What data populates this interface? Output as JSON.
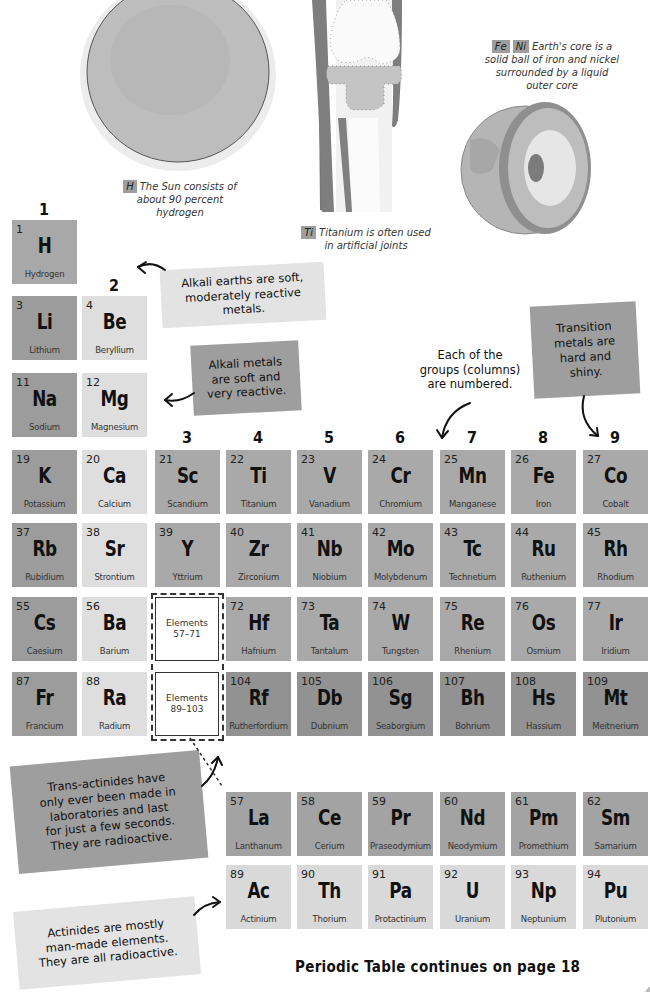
{
  "illustrations": {
    "sun": {
      "tag": "H",
      "caption_lines": [
        "The Sun consists of",
        "about 90 percent",
        "hydrogen"
      ]
    },
    "knee_joint": {
      "tag": "Ti",
      "caption_lines": [
        "Titanium is often used",
        "in artificial joints"
      ]
    },
    "earth_core": {
      "tags": [
        "Fe",
        "Ni"
      ],
      "caption_lines": [
        "Earth's core is a",
        "solid ball of iron and nickel",
        "surrounded by a liquid",
        "outer core"
      ]
    }
  },
  "group_numbers": [
    "1",
    "2",
    "3",
    "4",
    "5",
    "6",
    "7",
    "8",
    "9"
  ],
  "elements": {
    "H": {
      "number": "1",
      "symbol": "H",
      "name": "Hydrogen"
    },
    "Li": {
      "number": "3",
      "symbol": "Li",
      "name": "Lithium"
    },
    "Be": {
      "number": "4",
      "symbol": "Be",
      "name": "Beryllium"
    },
    "Na": {
      "number": "11",
      "symbol": "Na",
      "name": "Sodium"
    },
    "Mg": {
      "number": "12",
      "symbol": "Mg",
      "name": "Magnesium"
    },
    "K": {
      "number": "19",
      "symbol": "K",
      "name": "Potassium"
    },
    "Ca": {
      "number": "20",
      "symbol": "Ca",
      "name": "Calcium"
    },
    "Sc": {
      "number": "21",
      "symbol": "Sc",
      "name": "Scandium"
    },
    "Ti": {
      "number": "22",
      "symbol": "Ti",
      "name": "Titanium"
    },
    "V": {
      "number": "23",
      "symbol": "V",
      "name": "Vanadium"
    },
    "Cr": {
      "number": "24",
      "symbol": "Cr",
      "name": "Chromium"
    },
    "Mn": {
      "number": "25",
      "symbol": "Mn",
      "name": "Manganese"
    },
    "Fe": {
      "number": "26",
      "symbol": "Fe",
      "name": "Iron"
    },
    "Co": {
      "number": "27",
      "symbol": "Co",
      "name": "Cobalt"
    },
    "Rb": {
      "number": "37",
      "symbol": "Rb",
      "name": "Rubidium"
    },
    "Sr": {
      "number": "38",
      "symbol": "Sr",
      "name": "Strontium"
    },
    "Y": {
      "number": "39",
      "symbol": "Y",
      "name": "Yttrium"
    },
    "Zr": {
      "number": "40",
      "symbol": "Zr",
      "name": "Zirconium"
    },
    "Nb": {
      "number": "41",
      "symbol": "Nb",
      "name": "Niobium"
    },
    "Mo": {
      "number": "42",
      "symbol": "Mo",
      "name": "Molybdenum"
    },
    "Tc": {
      "number": "43",
      "symbol": "Tc",
      "name": "Technetium"
    },
    "Ru": {
      "number": "44",
      "symbol": "Ru",
      "name": "Ruthenium"
    },
    "Rh": {
      "number": "45",
      "symbol": "Rh",
      "name": "Rhodium"
    },
    "Cs": {
      "number": "55",
      "symbol": "Cs",
      "name": "Caesium"
    },
    "Ba": {
      "number": "56",
      "symbol": "Ba",
      "name": "Barium"
    },
    "Hf": {
      "number": "72",
      "symbol": "Hf",
      "name": "Hafnium"
    },
    "Ta": {
      "number": "73",
      "symbol": "Ta",
      "name": "Tantalum"
    },
    "W": {
      "number": "74",
      "symbol": "W",
      "name": "Tungsten"
    },
    "Re": {
      "number": "75",
      "symbol": "Re",
      "name": "Rhenium"
    },
    "Os": {
      "number": "76",
      "symbol": "Os",
      "name": "Osmium"
    },
    "Ir": {
      "number": "77",
      "symbol": "Ir",
      "name": "Iridium"
    },
    "Fr": {
      "number": "87",
      "symbol": "Fr",
      "name": "Francium"
    },
    "Ra": {
      "number": "88",
      "symbol": "Ra",
      "name": "Radium"
    },
    "Rf": {
      "number": "104",
      "symbol": "Rf",
      "name": "Rutherfordium"
    },
    "Db": {
      "number": "105",
      "symbol": "Db",
      "name": "Dubnium"
    },
    "Sg": {
      "number": "106",
      "symbol": "Sg",
      "name": "Seaborgium"
    },
    "Bh": {
      "number": "107",
      "symbol": "Bh",
      "name": "Bohrium"
    },
    "Hs": {
      "number": "108",
      "symbol": "Hs",
      "name": "Hassium"
    },
    "Mt": {
      "number": "109",
      "symbol": "Mt",
      "name": "Meitnerium"
    },
    "La": {
      "number": "57",
      "symbol": "La",
      "name": "Lanthanum"
    },
    "Ce": {
      "number": "58",
      "symbol": "Ce",
      "name": "Cerium"
    },
    "Pr": {
      "number": "59",
      "symbol": "Pr",
      "name": "Praseodymium"
    },
    "Nd": {
      "number": "60",
      "symbol": "Nd",
      "name": "Neodymium"
    },
    "Pm": {
      "number": "61",
      "symbol": "Pm",
      "name": "Promethium"
    },
    "Sm": {
      "number": "62",
      "symbol": "Sm",
      "name": "Samarium"
    },
    "Ac": {
      "number": "89",
      "symbol": "Ac",
      "name": "Actinium"
    },
    "Th": {
      "number": "90",
      "symbol": "Th",
      "name": "Thorium"
    },
    "Pa": {
      "number": "91",
      "symbol": "Pa",
      "name": "Protactinium"
    },
    "U": {
      "number": "92",
      "symbol": "U",
      "name": "Uranium"
    },
    "Np": {
      "number": "93",
      "symbol": "Np",
      "name": "Neptunium"
    },
    "Pu": {
      "number": "94",
      "symbol": "Pu",
      "name": "Plutonium"
    }
  },
  "placeholders": {
    "lanthanides": {
      "line1": "Elements",
      "line2": "57–71"
    },
    "actinides": {
      "line1": "Elements",
      "line2": "89–103"
    }
  },
  "notes": {
    "alkali_earths": [
      "Alkali earths are soft,",
      "moderately reactive metals."
    ],
    "alkali_metals": [
      "Alkali metals",
      "are soft and",
      "very reactive."
    ],
    "groups_numbered": [
      "Each of the",
      "groups (columns)",
      "are numbered."
    ],
    "transition_metals": [
      "Transition",
      "metals are",
      "hard and",
      "shiny."
    ],
    "trans_actinides": [
      "Trans-actinides have",
      "only ever been made in",
      "laboratories and last",
      "for just a few seconds.",
      "They are radioactive."
    ],
    "actinides": [
      "Actinides are mostly",
      "man-made elements.",
      "They are all radioactive."
    ]
  },
  "footer": {
    "continues": "Periodic Table continues on page 18"
  },
  "colors": {
    "alkali": "#9c9c9c",
    "alkali_earth": "#dedede",
    "transition": "#a9a9a9",
    "trans_actinide": "#929292",
    "lanthanide": "#a3a3a3",
    "actinide": "#d9d9d9"
  }
}
